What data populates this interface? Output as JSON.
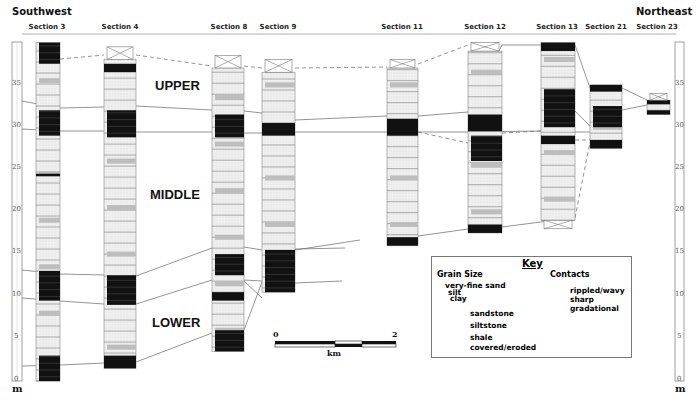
{
  "header": {
    "left_direction": "Southwest",
    "right_direction": "Northeast"
  },
  "sections": [
    {
      "id": "s3",
      "label": "Section 3",
      "x": 36,
      "w": 24,
      "label_x": 47
    },
    {
      "id": "s4",
      "label": "Section 4",
      "x": 104,
      "w": 32,
      "label_x": 120
    },
    {
      "id": "s8",
      "label": "Section 8",
      "x": 212,
      "w": 32,
      "label_x": 228
    },
    {
      "id": "s9",
      "label": "Section 9",
      "x": 262,
      "w": 33,
      "label_x": 278
    },
    {
      "id": "s11",
      "label": "Section 11",
      "x": 387,
      "w": 31,
      "label_x": 402
    },
    {
      "id": "s12",
      "label": "Section 12",
      "x": 468,
      "w": 34,
      "label_x": 485
    },
    {
      "id": "s13",
      "label": "Section 13",
      "x": 541,
      "w": 34,
      "label_x": 557
    },
    {
      "id": "s21",
      "label": "Section 21",
      "x": 590,
      "w": 32,
      "label_x": 606
    },
    {
      "id": "s23",
      "label": "Section 23",
      "x": 647,
      "w": 23,
      "label_x": 657
    }
  ],
  "units": {
    "upper": "UPPER",
    "middle": "MIDDLE",
    "lower": "LOWER"
  },
  "axis": {
    "unit": "m",
    "ticks": [
      "0",
      "5",
      "10",
      "15",
      "20",
      "25",
      "30",
      "35"
    ],
    "min": 0,
    "max": 38
  },
  "scale_bar": {
    "start": "0",
    "end": "2",
    "unit": "km"
  },
  "key": {
    "title": "Key",
    "grain_size_heading": "Grain Size",
    "grain_sizes": [
      "very-fine sand",
      "silt",
      "clay"
    ],
    "lithologies": [
      {
        "name": "sandstone",
        "color": "#ececec"
      },
      {
        "name": "siltstone",
        "color": "#bdbdbd"
      },
      {
        "name": "shale",
        "color": "#111111"
      },
      {
        "name": "covered/eroded",
        "color": "#ffffff"
      }
    ],
    "contacts_heading": "Contacts",
    "contacts": [
      "rippled/wavy",
      "sharp",
      "gradational"
    ]
  },
  "colors": {
    "sandstone": "#ececec",
    "siltstone": "#bdbdbd",
    "shale": "#111111",
    "line": "#555555"
  },
  "chart_data": {
    "type": "stratigraphic-cross-section",
    "title": "",
    "orientation": {
      "left": "Southwest",
      "right": "Northeast"
    },
    "ylabel": "m",
    "ylim": [
      0,
      38
    ],
    "yticks": [
      0,
      5,
      10,
      15,
      20,
      25,
      30,
      35
    ],
    "units": [
      "UPPER",
      "MIDDLE",
      "LOWER"
    ],
    "scale_bar_km": [
      0,
      2
    ],
    "columns": [
      {
        "section": "Section 3",
        "base_m": 0,
        "top_m": 40,
        "shale_intervals_m": [
          [
            0,
            3
          ],
          [
            9.5,
            13
          ],
          [
            24.2,
            24.5
          ],
          [
            29,
            32
          ],
          [
            37.5,
            40
          ]
        ]
      },
      {
        "section": "Section 4",
        "base_m": 1.5,
        "top_m": 39.5,
        "shale_intervals_m": [
          [
            1.5,
            3
          ],
          [
            9,
            12.5
          ],
          [
            28.8,
            32
          ],
          [
            36.5,
            37.5
          ]
        ],
        "covered_top_m": [
          38,
          39.5
        ]
      },
      {
        "section": "Section 8",
        "base_m": 3.5,
        "top_m": 38.5,
        "shale_intervals_m": [
          [
            3.5,
            6
          ],
          [
            9.5,
            10.5
          ],
          [
            12.5,
            15
          ],
          [
            28.8,
            31.5
          ]
        ],
        "covered_top_m": [
          37,
          38.5
        ]
      },
      {
        "section": "Section 9",
        "base_m": 10.5,
        "top_m": 38,
        "shale_intervals_m": [
          [
            10.5,
            15.5
          ],
          [
            29,
            30.5
          ]
        ],
        "covered_top_m": [
          36.5,
          38
        ]
      },
      {
        "section": "Section 11",
        "base_m": 16,
        "top_m": 38,
        "shale_intervals_m": [
          [
            16,
            17
          ],
          [
            29,
            31
          ]
        ],
        "covered_top_m": [
          37,
          38
        ]
      },
      {
        "section": "Section 12",
        "base_m": 17.5,
        "top_m": 40,
        "shale_intervals_m": [
          [
            17.5,
            18.5
          ],
          [
            26,
            29
          ],
          [
            29.5,
            31.5
          ]
        ],
        "covered_top_m": [
          39,
          40
        ]
      },
      {
        "section": "Section 13",
        "base_m": 18,
        "top_m": 40,
        "shale_intervals_m": [
          [
            28,
            29
          ],
          [
            30,
            34.5
          ],
          [
            39,
            40
          ]
        ],
        "covered_bottom_m": [
          18,
          19
        ]
      },
      {
        "section": "Section 21",
        "base_m": 27.5,
        "top_m": 35,
        "shale_intervals_m": [
          [
            27.5,
            28.5
          ],
          [
            30,
            32.5
          ],
          [
            34.2,
            35
          ]
        ]
      },
      {
        "section": "Section 23",
        "base_m": 31.5,
        "top_m": 34,
        "shale_intervals_m": [
          [
            31.5,
            32
          ],
          [
            32.7,
            33.2
          ]
        ],
        "covered_top_m": [
          33.2,
          34
        ]
      }
    ]
  }
}
